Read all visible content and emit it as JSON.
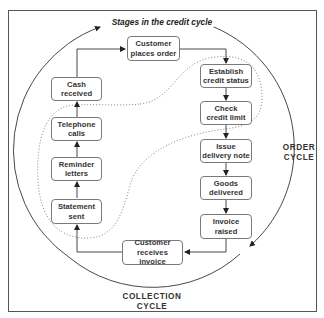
{
  "diagram": {
    "title": "Stages in the credit cycle",
    "cycle_labels": {
      "order": "ORDER\nCYCLE",
      "collection": "COLLECTION\nCYCLE"
    },
    "stages": {
      "customer_places_order": "Customer\nplaces order",
      "establish_credit_status": "Establish\ncredit status",
      "check_credit_limit": "Check\ncredit limit",
      "issue_delivery_note": "Issue\ndelivery note",
      "goods_delivered": "Goods\ndelivered",
      "invoice_raised": "Invoice\nraised",
      "customer_receives_invoice": "Customer\nreceives invoice",
      "statement_sent": "Statement\nsent",
      "reminder_letters": "Reminder\nletters",
      "telephone_calls": "Telephone\ncalls",
      "cash_received": "Cash\nreceived"
    },
    "flow_order": [
      "Customer places order",
      "Establish credit status",
      "Check credit limit",
      "Issue delivery note",
      "Goods delivered",
      "Invoice raised",
      "Customer receives invoice",
      "Statement sent",
      "Reminder letters",
      "Telephone calls",
      "Cash received"
    ],
    "colors": {
      "line": "#333333",
      "box_border": "#7a7a7a",
      "dotted": "#777777",
      "text": "#333333"
    }
  }
}
